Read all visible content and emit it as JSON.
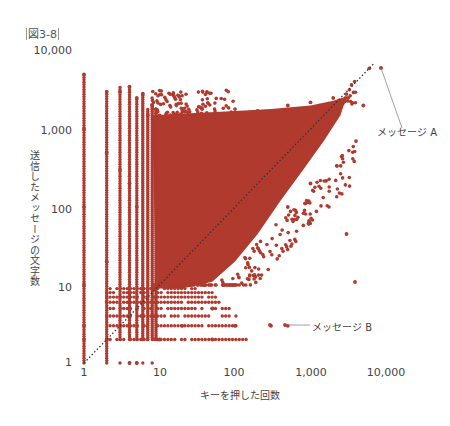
{
  "figure": {
    "label": "図3-8"
  },
  "chart_data": {
    "type": "scatter",
    "title": "",
    "xlabel": "キーを押した回数",
    "ylabel": "送信したメッセージの文字数",
    "xscale": "log",
    "yscale": "log",
    "xlim": [
      1,
      10000
    ],
    "ylim": [
      1,
      10000
    ],
    "x_ticks": [
      "1",
      "10",
      "100",
      "1,000",
      "10,000"
    ],
    "y_ticks": [
      "1",
      "10",
      "100",
      "1,000",
      "10,000"
    ],
    "grid": false,
    "legend": null,
    "point_color": "#b03a2e",
    "reference_line": {
      "type": "y=x",
      "style": "dotted",
      "color": "#333333",
      "from": [
        1,
        1
      ],
      "to": [
        7000,
        7000
      ]
    },
    "annotations": [
      {
        "label": "メッセージ A",
        "x": 6000,
        "y": 6000
      },
      {
        "label": "メッセージ B",
        "x": 300,
        "y": 3
      }
    ],
    "sample_points": [
      [
        1,
        5000
      ],
      [
        1,
        1000
      ],
      [
        1,
        100
      ],
      [
        1,
        10
      ],
      [
        1,
        2
      ],
      [
        1,
        3
      ],
      [
        2,
        3000
      ],
      [
        2,
        500
      ],
      [
        2,
        20
      ],
      [
        2,
        2
      ],
      [
        3,
        3000
      ],
      [
        3,
        300
      ],
      [
        3,
        3
      ],
      [
        4,
        3500
      ],
      [
        4,
        200
      ],
      [
        4,
        1
      ],
      [
        5,
        2500
      ],
      [
        5,
        100
      ],
      [
        5,
        1
      ],
      [
        6,
        2800
      ],
      [
        7,
        1500
      ],
      [
        8,
        2000
      ],
      [
        9,
        1800
      ],
      [
        10,
        1500
      ],
      [
        20,
        1500
      ],
      [
        50,
        1500
      ],
      [
        100,
        1800
      ],
      [
        200,
        1700
      ],
      [
        500,
        2000
      ],
      [
        1000,
        2200
      ],
      [
        2000,
        2500
      ],
      [
        3000,
        2800
      ],
      [
        6000,
        6000
      ],
      [
        5000,
        2000
      ],
      [
        4000,
        700
      ],
      [
        3000,
        45
      ],
      [
        1000,
        200
      ],
      [
        500,
        100
      ],
      [
        200,
        30
      ],
      [
        100,
        10
      ],
      [
        50,
        5
      ],
      [
        20,
        3
      ],
      [
        10,
        2
      ],
      [
        100,
        3
      ],
      [
        50,
        2
      ],
      [
        300,
        3
      ],
      [
        500,
        3
      ]
    ]
  }
}
